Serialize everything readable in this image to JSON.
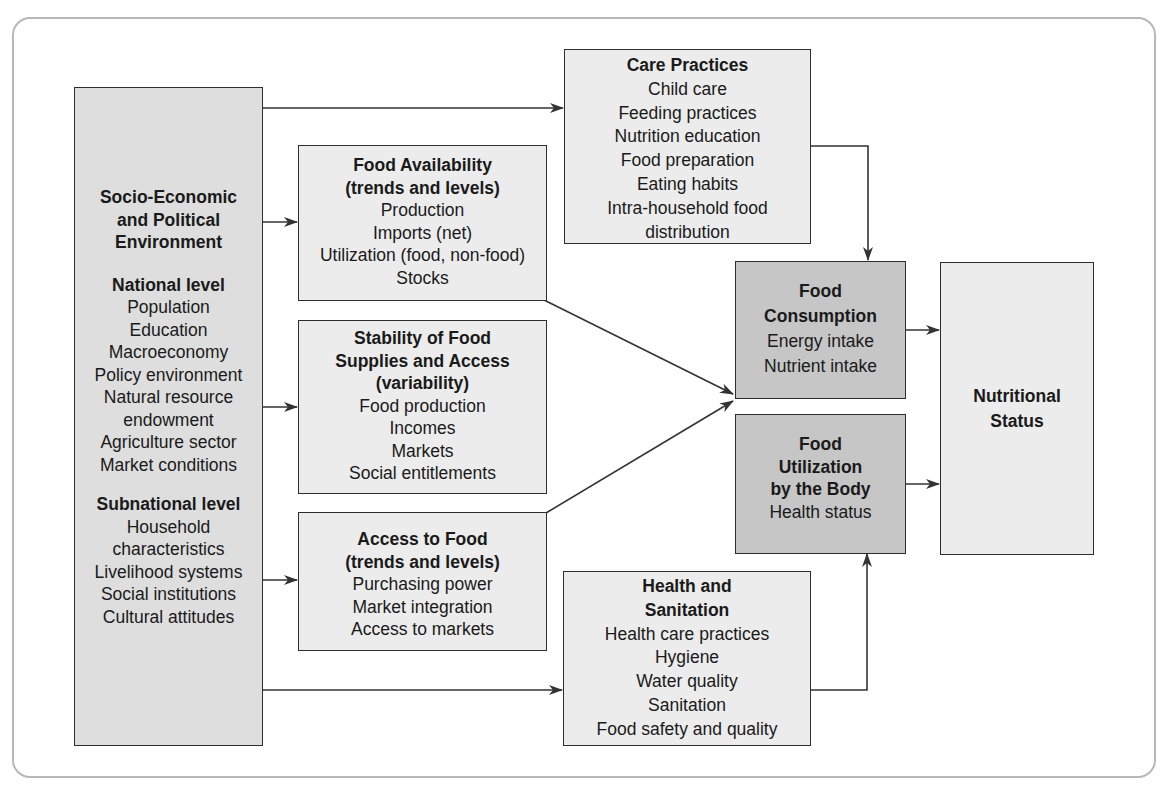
{
  "diagram": {
    "type": "conceptual framework flowchart",
    "colors": {
      "light_box": "#ececec",
      "left_box": "#dedede",
      "dark_box": "#c6c6c6",
      "line": "#333333",
      "frame": "#b8b8b8"
    },
    "socio_economic": {
      "title": "Socio-Economic and Political Environment",
      "title_lines": [
        "Socio-Economic",
        "and Political",
        "Environment"
      ],
      "national": {
        "heading": "National level",
        "items": [
          "Population",
          "Education",
          "Macroeconomy",
          "Policy environment",
          "Natural resource",
          "endowment",
          "Agriculture sector",
          "Market conditions"
        ]
      },
      "subnational": {
        "heading": "Subnational level",
        "items": [
          "Household",
          "characteristics",
          "Livelihood systems",
          "Social institutions",
          "Cultural attitudes"
        ]
      }
    },
    "food_availability": {
      "title_lines": [
        "Food Availability",
        "(trends and levels)"
      ],
      "items": [
        "Production",
        "Imports (net)",
        "Utilization (food, non-food)",
        "Stocks"
      ]
    },
    "stability": {
      "title_lines": [
        "Stability of Food",
        "Supplies and Access",
        "(variability)"
      ],
      "items": [
        "Food production",
        "Incomes",
        "Markets",
        "Social entitlements"
      ]
    },
    "access": {
      "title_lines": [
        "Access to Food",
        "(trends and levels)"
      ],
      "items": [
        "Purchasing power",
        "Market integration",
        "Access to markets"
      ]
    },
    "care_practices": {
      "title_lines": [
        "Care Practices"
      ],
      "items": [
        "Child care",
        "Feeding practices",
        "Nutrition education",
        "Food preparation",
        "Eating habits",
        "Intra-household food",
        "distribution"
      ]
    },
    "health_sanitation": {
      "title_lines": [
        "Health and",
        "Sanitation"
      ],
      "items": [
        "Health care practices",
        "Hygiene",
        "Water quality",
        "Sanitation",
        "Food safety and quality"
      ]
    },
    "food_consumption": {
      "title_lines": [
        "Food",
        "Consumption"
      ],
      "items": [
        "Energy intake",
        "Nutrient intake"
      ]
    },
    "food_utilization": {
      "title_lines": [
        "Food",
        "Utilization",
        "by the Body"
      ],
      "items": [
        "Health status"
      ]
    },
    "nutritional_status": {
      "title_lines": [
        "Nutritional",
        "Status"
      ]
    },
    "edges": [
      {
        "from": "socio_economic",
        "to": "care_practices"
      },
      {
        "from": "socio_economic",
        "to": "food_availability"
      },
      {
        "from": "socio_economic",
        "to": "stability"
      },
      {
        "from": "socio_economic",
        "to": "access"
      },
      {
        "from": "socio_economic",
        "to": "health_sanitation"
      },
      {
        "from": "food_availability",
        "to": "food_consumption"
      },
      {
        "from": "access",
        "to": "food_consumption"
      },
      {
        "from": "care_practices",
        "to": "food_consumption"
      },
      {
        "from": "health_sanitation",
        "to": "food_utilization"
      },
      {
        "from": "food_consumption",
        "to": "nutritional_status"
      },
      {
        "from": "food_utilization",
        "to": "nutritional_status"
      }
    ]
  }
}
